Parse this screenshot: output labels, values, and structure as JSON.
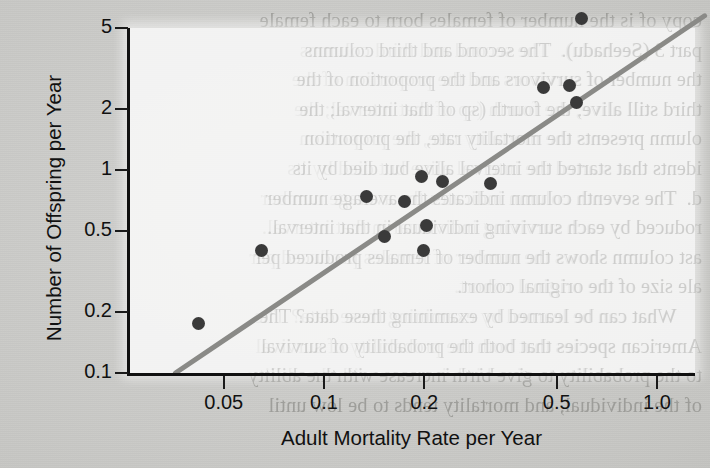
{
  "page": {
    "background_color": "#c9c9c7",
    "bleed_through_text": "copy of is the number of females born to each female\npart 3 (Seehadu).  The second and third columns\nthe number of survivors and the proportion of the\nthird still alive; the fourth (sp of that interval; the\nolumn presents the mortality rate, the proportion\nidents that started the interval alive but died by its\nd.  The seventh column indicates the average number\nroduced by each surviving individual in that interval.\nast column shows the number of females produced per\nale size of the original cohort.\n     What can be learned by examining these data? The\nAmerican species that both the probability of survival\nto the probability to give birth increase with the ability\nof the individual, and mortality tends to be low until"
  },
  "chart_data": {
    "type": "scatter",
    "title": "",
    "xlabel": "Adult Mortality Rate per Year",
    "ylabel": "Number of Offspring per Year",
    "xscale": "log",
    "yscale": "log",
    "xlim": [
      0.0335,
      1.55
    ],
    "ylim": [
      0.1,
      6.9
    ],
    "grid": false,
    "legend": null,
    "xticks": [
      0.05,
      0.1,
      0.2,
      0.5,
      1.0
    ],
    "xticklabels": [
      "0.05",
      "0.1",
      "0.2",
      "0.5",
      "1.0"
    ],
    "yticks": [
      0.1,
      0.2,
      0.5,
      1,
      2,
      5
    ],
    "yticklabels": [
      "0.1",
      "0.2",
      "0.5",
      "1",
      "2",
      "5"
    ],
    "marker": {
      "shape": "circle",
      "color": "#3a3a3a",
      "size_px": 13
    },
    "points": [
      {
        "x": 0.042,
        "y": 0.175
      },
      {
        "x": 0.065,
        "y": 0.4
      },
      {
        "x": 0.134,
        "y": 0.74
      },
      {
        "x": 0.152,
        "y": 0.47
      },
      {
        "x": 0.174,
        "y": 0.7
      },
      {
        "x": 0.196,
        "y": 0.93
      },
      {
        "x": 0.199,
        "y": 0.4
      },
      {
        "x": 0.203,
        "y": 0.53
      },
      {
        "x": 0.227,
        "y": 0.88
      },
      {
        "x": 0.316,
        "y": 0.86
      },
      {
        "x": 0.455,
        "y": 2.55
      },
      {
        "x": 0.545,
        "y": 2.62
      },
      {
        "x": 0.575,
        "y": 2.15
      },
      {
        "x": 0.595,
        "y": 5.55
      }
    ],
    "fit_line": {
      "style": "solid",
      "color": "#8a8a87",
      "width_px": 5,
      "x_start": 0.0358,
      "y_start": 0.1,
      "x_end": 1.39,
      "y_end": 5.75
    }
  }
}
